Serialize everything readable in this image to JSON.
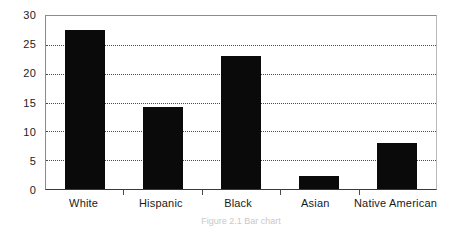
{
  "chart_data": {
    "type": "bar",
    "title": "",
    "subtitle": "",
    "xlabel": "",
    "ylabel": "",
    "categories": [
      "White",
      "Hispanic",
      "Black",
      "Asian",
      "Native American"
    ],
    "values": [
      27.5,
      14.3,
      23.0,
      2.2,
      7.9
    ],
    "series": [
      {
        "name": "",
        "values": [
          27.5,
          14.3,
          23.0,
          2.2,
          7.9
        ]
      }
    ],
    "ylim": [
      0,
      30
    ],
    "yticks": [
      0,
      5,
      10,
      15,
      20,
      25,
      30
    ],
    "ytick_labels": [
      "0",
      "5",
      "10",
      "15",
      "20",
      "25",
      "30"
    ],
    "grid": true,
    "grid_axis": "y",
    "grid_style": "dotted",
    "legend": false,
    "legend_position": "none",
    "bar_color": "#0a0a0a",
    "plot_background": "#ffffff",
    "annotations": []
  },
  "caption": {
    "text": "Figure 2.1  Bar chart",
    "visible": "partial"
  }
}
